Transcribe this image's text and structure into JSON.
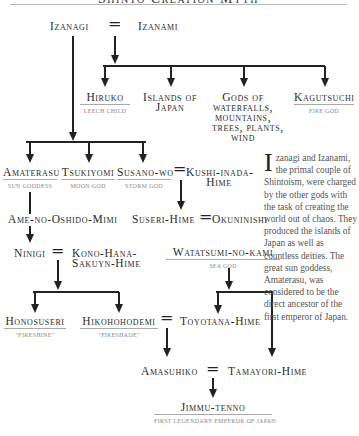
{
  "title": "Shinto Creation Myth",
  "diagram": {
    "couple_top": {
      "left": "Izanagi",
      "right": "Izanami",
      "join": "="
    },
    "children_of_izanami": [
      {
        "name": "Hiruko",
        "subtitle": "Leech child"
      },
      {
        "name": "Islands of Japan",
        "line1": "Islands of",
        "line2": "Japan"
      },
      {
        "name": "Gods of waterfalls, mountains, trees, plants, wind",
        "line1": "Gods of",
        "line2": "waterfalls,",
        "line3": "mountains,",
        "line4": "trees, plants,",
        "line5": "wind"
      },
      {
        "name": "Kagutsuchi",
        "subtitle": "Fire god"
      }
    ],
    "children_of_izanagi": [
      {
        "name": "Amaterasu",
        "subtitle": "Sun goddess"
      },
      {
        "name": "Tsukiyomi",
        "subtitle": "Moon god"
      },
      {
        "name": "Susano-wo",
        "subtitle": "Storm god"
      }
    ],
    "susano_spouse": {
      "line1": "Kushi-inada-",
      "line2": "Hime"
    },
    "suseri_couple": {
      "left": "Suseri-Hime",
      "right": "Okuninishi"
    },
    "ame": "Ame-no-Oshido-Mimi",
    "ninigi_couple": {
      "left": "Ninigi",
      "right_line1": "Kono-Hana-",
      "right_line2": "Sakuyn-Hime"
    },
    "watatsumi": {
      "name": "Watatsumi-no-kami",
      "subtitle": "Sea god"
    },
    "honosuseri": {
      "name": "Honosuseri",
      "subtitle": "\"Fireshine\""
    },
    "hikohohodemi": {
      "name": "Hikohohodemi",
      "subtitle": "\"Fireshade\""
    },
    "toyotana": "Toyotana-Hime",
    "amasuhiko": "Amasuhiko",
    "tamayori": "Tamayori-Hime",
    "jimmu": {
      "name": "Jimmu-tenno",
      "subtitle": "First legendary emperor of Japan"
    },
    "equals": "="
  },
  "sidebar_text": {
    "dropcap": "I",
    "body": "zanagi and Izanami, the primal couple of Shintoism, were charged by the other gods with the task of creating the world out of chaos. They produced the islands of Japan as well as countless deities. The great sun goddess, Amaterasu, was considered to be the direct ancestor of the first emperor of Japan."
  }
}
